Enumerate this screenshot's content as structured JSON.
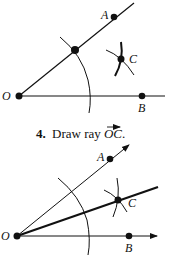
{
  "top_figure": {
    "points": {
      "O": {
        "label": "O",
        "x": 19,
        "y": 96
      },
      "A": {
        "label": "A",
        "x": 114,
        "y": 17
      },
      "B": {
        "label": "B",
        "x": 142,
        "y": 96
      },
      "C": {
        "label": "C",
        "x": 121,
        "y": 59
      },
      "arc_intersection": {
        "x": 75,
        "y": 50
      }
    }
  },
  "caption": {
    "number": "4.",
    "text": "Draw ray ",
    "ray_name": "OC",
    "period": "."
  },
  "bottom_figure": {
    "points": {
      "O": {
        "label": "O",
        "x": 17,
        "y": 236
      },
      "A": {
        "label": "A",
        "x": 110,
        "y": 159
      },
      "B": {
        "label": "B",
        "x": 129,
        "y": 236
      },
      "C": {
        "label": "C",
        "x": 118,
        "y": 200
      }
    }
  },
  "colors": {
    "ink": "#111111",
    "background": "#ffffff"
  }
}
